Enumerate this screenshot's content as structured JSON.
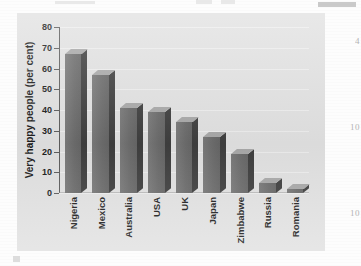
{
  "chart_data": {
    "type": "bar",
    "title": "",
    "xlabel": "",
    "ylabel": "Very happy people (per cent)",
    "ylim": [
      0,
      80
    ],
    "yticks": [
      0,
      10,
      20,
      30,
      40,
      50,
      60,
      70,
      80
    ],
    "grid": true,
    "legend": "none",
    "style": "3d-column",
    "categories": [
      "Nigeria",
      "Mexico",
      "Australia",
      "USA",
      "UK",
      "Japan",
      "Zimbabwe",
      "Russia",
      "Romania"
    ],
    "values": [
      67,
      57,
      41,
      39,
      34,
      27,
      19,
      5,
      2
    ]
  },
  "colors": {
    "bar_face": "#717171",
    "bar_side": "#3f3f3f",
    "bar_top": "#a9a9a9",
    "panel_background": "#e2e2e2",
    "gridline": "#f0f0f0",
    "axis": "#5d5d5d",
    "text": "#1c1c1c",
    "page_background": "#fdfdfd"
  },
  "margin_artifacts": {
    "fragment_a": "4",
    "fragment_b": "10",
    "fragment_c": "10"
  }
}
